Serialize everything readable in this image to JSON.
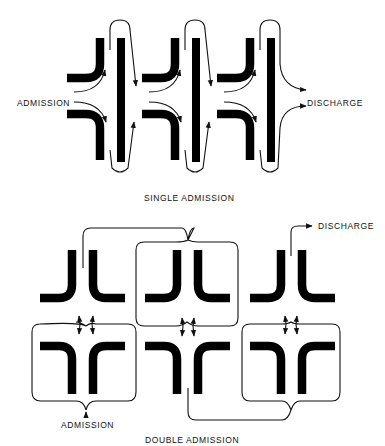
{
  "diagram": {
    "top": {
      "title": "SINGLE ADMISSION",
      "left_label": "ADMISSION",
      "right_label": "DISCHARGE",
      "stages": 3
    },
    "bottom": {
      "title": "DOUBLE ADMISSION",
      "inlet_label": "ADMISSION",
      "outlet_label": "DISCHARGE",
      "stages": 3
    },
    "colors": {
      "ink": "#000000",
      "background": "#ffffff"
    }
  }
}
